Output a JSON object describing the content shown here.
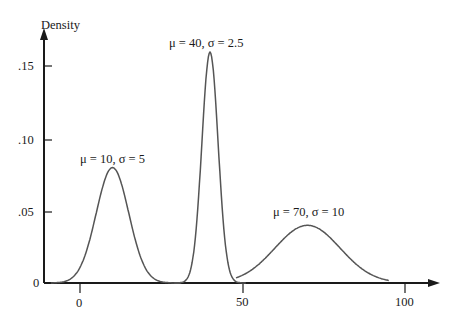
{
  "chart_data": {
    "type": "line",
    "title": "",
    "xlabel": "",
    "ylabel": "Density",
    "xlim": [
      -10,
      108
    ],
    "ylim": [
      0,
      0.175
    ],
    "x_ticks": [
      0,
      50,
      100
    ],
    "x_tick_labels": [
      "0",
      "50",
      "100"
    ],
    "y_ticks": [
      0,
      0.05,
      0.1,
      0.15
    ],
    "y_tick_labels": [
      "0",
      ".05",
      ".10",
      ".15"
    ],
    "grid": false,
    "legend": null,
    "series": [
      {
        "name": "μ = 10, σ = 5",
        "mu": 10,
        "sigma": 5,
        "x_range": [
          -9,
          31
        ],
        "peak_density": 0.0798
      },
      {
        "name": "μ = 40, σ = 2.5",
        "mu": 40,
        "sigma": 2.5,
        "x_range": [
          29,
          51
        ],
        "peak_density": 0.1596
      },
      {
        "name": "μ = 70, σ = 10",
        "mu": 70,
        "sigma": 10,
        "x_range": [
          48,
          95
        ],
        "peak_density": 0.0399
      }
    ],
    "annotations": [
      {
        "text": "μ = 10, σ = 5",
        "x": 10,
        "y": 0.086
      },
      {
        "text": "μ = 40, σ = 2.5",
        "x": 40,
        "y": 0.167
      },
      {
        "text": "μ = 70, σ = 10",
        "x": 70,
        "y": 0.047
      }
    ]
  },
  "labels": {
    "ylabel": "Density",
    "y_ticks": [
      ".15",
      ".10",
      ".05",
      "0"
    ],
    "x_ticks": [
      "0",
      "50",
      "100"
    ],
    "annotations": [
      "μ = 10, σ = 5",
      "μ = 40, σ = 2.5",
      "μ = 70, σ = 10"
    ]
  }
}
